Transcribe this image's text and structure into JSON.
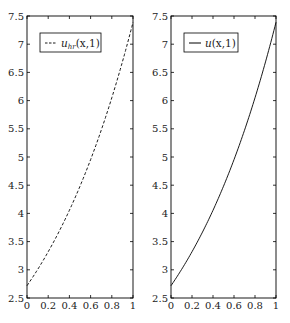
{
  "chart_data": [
    {
      "type": "line",
      "title": "",
      "xlabel": "",
      "ylabel": "",
      "xlim": [
        0,
        1
      ],
      "ylim": [
        2.5,
        7.5
      ],
      "grid": false,
      "legend_position": "upper left",
      "xticks": [
        "0",
        "0.2",
        "0.4",
        "0.6",
        "0.8",
        "1"
      ],
      "yticks": [
        "2.5",
        "3",
        "3.5",
        "4",
        "4.5",
        "5",
        "5.5",
        "6",
        "6.5",
        "7",
        "7.5"
      ],
      "series": [
        {
          "name": "u_hr(x,1)",
          "style": "dashed",
          "color": "#000000",
          "x": [
            0,
            0.1,
            0.2,
            0.3,
            0.4,
            0.5,
            0.6,
            0.7,
            0.8,
            0.9,
            1.0
          ],
          "y": [
            2.718,
            3.004,
            3.32,
            3.669,
            4.055,
            4.482,
            4.953,
            5.474,
            6.05,
            6.686,
            7.389
          ]
        }
      ]
    },
    {
      "type": "line",
      "title": "",
      "xlabel": "",
      "ylabel": "",
      "xlim": [
        0,
        1
      ],
      "ylim": [
        2.5,
        7.5
      ],
      "grid": false,
      "legend_position": "upper left",
      "xticks": [
        "0",
        "0.2",
        "0.4",
        "0.6",
        "0.8",
        "1"
      ],
      "yticks": [
        "2.5",
        "3",
        "3.5",
        "4",
        "4.5",
        "5",
        "5.5",
        "6",
        "6.5",
        "7",
        "7.5"
      ],
      "series": [
        {
          "name": "u(x,1)",
          "style": "solid",
          "color": "#000000",
          "x": [
            0,
            0.1,
            0.2,
            0.3,
            0.4,
            0.5,
            0.6,
            0.7,
            0.8,
            0.9,
            1.0
          ],
          "y": [
            2.718,
            3.004,
            3.32,
            3.669,
            4.055,
            4.482,
            4.953,
            5.474,
            6.05,
            6.686,
            7.389
          ]
        }
      ]
    }
  ],
  "legends": {
    "left": {
      "base": "u",
      "sub": "hr",
      "args": "(x,1)"
    },
    "right": {
      "base": "u",
      "args": "(x,1)"
    }
  }
}
